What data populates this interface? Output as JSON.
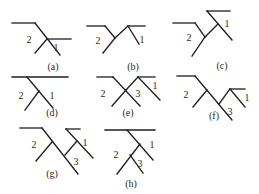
{
  "figure": {
    "panels": [
      {
        "id": "a",
        "caption": "(a)",
        "caption_pos": [
          53,
          70
        ],
        "lines": [
          [
            12,
            23,
            35,
            23
          ],
          [
            35,
            23,
            60,
            55
          ],
          [
            47,
            39,
            71,
            39
          ],
          [
            47,
            39,
            35,
            53
          ]
        ],
        "labels": [
          {
            "text": "2",
            "pos": [
              29,
              43
            ]
          },
          {
            "text": "1",
            "pos": [
              56,
              51
            ]
          }
        ]
      },
      {
        "id": "b",
        "caption": "(b)",
        "caption_pos": [
          133,
          70
        ],
        "lines": [
          [
            87,
            26,
            105,
            26
          ],
          [
            105,
            26,
            115,
            38
          ],
          [
            115,
            38,
            103,
            53
          ],
          [
            115,
            38,
            128,
            26
          ],
          [
            128,
            26,
            145,
            26
          ],
          [
            128,
            26,
            139,
            44
          ]
        ],
        "labels": [
          {
            "text": "2",
            "pos": [
              98,
              44
            ]
          },
          {
            "text": "1",
            "pos": [
              142,
              43
            ]
          }
        ]
      },
      {
        "id": "c",
        "caption": "(c)",
        "caption_pos": [
          222,
          69
        ],
        "lines": [
          [
            173,
            23,
            195,
            23
          ],
          [
            195,
            23,
            205,
            37
          ],
          [
            205,
            37,
            192,
            56
          ],
          [
            205,
            37,
            218,
            24
          ],
          [
            207,
            11,
            230,
            11
          ],
          [
            207,
            11,
            232,
            40
          ]
        ],
        "labels": [
          {
            "text": "2",
            "pos": [
              189,
              41
            ]
          },
          {
            "text": "1",
            "pos": [
              227,
              27
            ]
          }
        ]
      },
      {
        "id": "d",
        "caption": "(d)",
        "caption_pos": [
          52,
          116
        ],
        "lines": [
          [
            12,
            77,
            68,
            77
          ],
          [
            27,
            77,
            53,
            108
          ],
          [
            39,
            91,
            25,
            110
          ]
        ],
        "labels": [
          {
            "text": "2",
            "pos": [
              21,
              99
            ]
          },
          {
            "text": "1",
            "pos": [
              52,
              99
            ]
          }
        ]
      },
      {
        "id": "e",
        "caption": "(e)",
        "caption_pos": [
          128,
          116
        ],
        "lines": [
          [
            97,
            77,
            113,
            77
          ],
          [
            113,
            77,
            140,
            106
          ],
          [
            126,
            90,
            112,
            106
          ],
          [
            126,
            90,
            138,
            77
          ],
          [
            138,
            77,
            155,
            77
          ],
          [
            138,
            77,
            160,
            100
          ]
        ],
        "labels": [
          {
            "text": "2",
            "pos": [
              103,
              97
            ]
          },
          {
            "text": "3",
            "pos": [
              138,
              97
            ]
          },
          {
            "text": "1",
            "pos": [
              155,
              89
            ]
          }
        ]
      },
      {
        "id": "f",
        "caption": "(f)",
        "caption_pos": [
          214,
          119
        ],
        "lines": [
          [
            177,
            76,
            195,
            76
          ],
          [
            195,
            76,
            232,
            120
          ],
          [
            207,
            90,
            193,
            107
          ],
          [
            219,
            104,
            230,
            89
          ],
          [
            230,
            89,
            245,
            89
          ],
          [
            230,
            89,
            245,
            107
          ]
        ],
        "labels": [
          {
            "text": "2",
            "pos": [
              186,
              98
            ]
          },
          {
            "text": "3",
            "pos": [
              230,
              115
            ]
          },
          {
            "text": "1",
            "pos": [
              247,
              101
            ]
          }
        ]
      },
      {
        "id": "g",
        "caption": "(g)",
        "caption_pos": [
          52,
          177
        ],
        "lines": [
          [
            20,
            128,
            42,
            128
          ],
          [
            42,
            128,
            78,
            174
          ],
          [
            52,
            142,
            36,
            161
          ],
          [
            65,
            155,
            77,
            141
          ],
          [
            66,
            129,
            80,
            129
          ],
          [
            66,
            129,
            93,
            158
          ]
        ],
        "labels": [
          {
            "text": "2",
            "pos": [
              34,
              148
            ]
          },
          {
            "text": "1",
            "pos": [
              85,
              146
            ]
          },
          {
            "text": "3",
            "pos": [
              76,
              165
            ]
          }
        ]
      },
      {
        "id": "h",
        "caption": "(h)",
        "caption_pos": [
          131,
          187
        ],
        "lines": [
          [
            105,
            130,
            155,
            130
          ],
          [
            127,
            130,
            153,
            160
          ],
          [
            140,
            144,
            117,
            174
          ],
          [
            130,
            155,
            143,
            173
          ]
        ],
        "labels": [
          {
            "text": "1",
            "pos": [
              152,
              148
            ]
          },
          {
            "text": "2",
            "pos": [
              116,
              158
            ]
          },
          {
            "text": "3",
            "pos": [
              140,
              167
            ]
          }
        ]
      }
    ]
  }
}
